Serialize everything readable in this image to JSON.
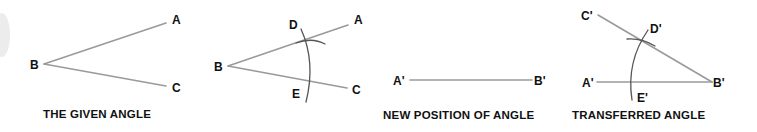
{
  "figure": {
    "colors": {
      "background": "#ffffff",
      "line": "#9a9a9a",
      "arc": "#555555",
      "text": "#111111"
    },
    "panels": [
      {
        "id": "given-angle",
        "caption": "THE GIVEN ANGLE",
        "points": {
          "A": "A",
          "B": "B",
          "C": "C"
        }
      },
      {
        "id": "construction",
        "caption": "",
        "points": {
          "A": "A",
          "B": "B",
          "C": "C",
          "D": "D",
          "E": "E"
        }
      },
      {
        "id": "new-position",
        "caption": "NEW POSITION OF ANGLE",
        "points": {
          "A": "A'",
          "B": "B'"
        }
      },
      {
        "id": "transferred-angle",
        "caption": "TRANSFERRED ANGLE",
        "points": {
          "A": "A'",
          "B": "B'",
          "C": "C'",
          "D": "D'",
          "E": "E'"
        }
      }
    ]
  }
}
